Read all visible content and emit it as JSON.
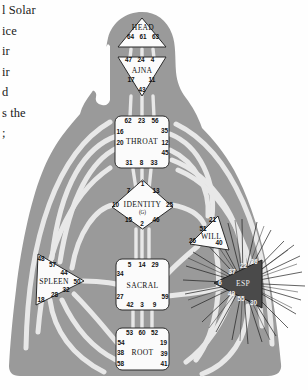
{
  "page": {
    "book_text_lines": [
      "l  Solar",
      "ice",
      "ir",
      "ir",
      "d",
      "s the",
      ";"
    ],
    "diagram_title": "Human Design BodyGraph"
  },
  "colors": {
    "body_silhouette": "#9a9a9a",
    "channel_open": "#e8e8e8",
    "center_open_fill": "#fbfbfb",
    "center_defined_fill": "#4a4a4a",
    "center_stroke": "#2b2b2b",
    "gate_text": "#111111",
    "gate_text_light": "#f2f2f2",
    "page_background": "#ffffff",
    "ray_stroke": "#1d1d1d"
  },
  "centers": [
    {
      "id": "head",
      "name": "HEAD",
      "shape": "triangle-up",
      "defined": false,
      "gates": [
        {
          "num": "64",
          "x": 130.5,
          "y": 38.5
        },
        {
          "num": "61",
          "x": 143.0,
          "y": 38.5
        },
        {
          "num": "63",
          "x": 155.5,
          "y": 38.5
        }
      ],
      "label": {
        "x": 143.0,
        "y": 29.5
      }
    },
    {
      "id": "ajna",
      "name": "AJNA",
      "shape": "triangle-down",
      "defined": false,
      "gates": [
        {
          "num": "47",
          "x": 128.5,
          "y": 61.0
        },
        {
          "num": "24",
          "x": 141.0,
          "y": 61.0
        },
        {
          "num": "4",
          "x": 152.5,
          "y": 61.0
        },
        {
          "num": "17",
          "x": 131.0,
          "y": 80.0
        },
        {
          "num": "11",
          "x": 152.0,
          "y": 80.0
        },
        {
          "num": "43",
          "x": 142.0,
          "y": 91.0
        }
      ],
      "label": {
        "x": 142.0,
        "y": 71.5
      }
    },
    {
      "id": "throat",
      "name": "THROAT",
      "shape": "square",
      "defined": false,
      "gates": [
        {
          "num": "62",
          "x": 128.0,
          "y": 121.5
        },
        {
          "num": "23",
          "x": 141.5,
          "y": 121.5
        },
        {
          "num": "56",
          "x": 155.0,
          "y": 121.5
        },
        {
          "num": "16",
          "x": 118.5,
          "y": 132.5
        },
        {
          "num": "35",
          "x": 165.5,
          "y": 131.5
        },
        {
          "num": "20",
          "x": 118.5,
          "y": 143.5
        },
        {
          "num": "12",
          "x": 166.0,
          "y": 142.5
        },
        {
          "num": "45",
          "x": 166.0,
          "y": 153.0
        },
        {
          "num": "31",
          "x": 129.0,
          "y": 163.0
        },
        {
          "num": "8",
          "x": 141.5,
          "y": 163.0
        },
        {
          "num": "33",
          "x": 154.0,
          "y": 163.0
        }
      ],
      "label": {
        "x": 142.0,
        "y": 141.5
      }
    },
    {
      "id": "identity",
      "name": "IDENTITY",
      "sub_label": "(G)",
      "shape": "diamond",
      "defined": false,
      "gates": [
        {
          "num": "1",
          "x": 142.5,
          "y": 184.5
        },
        {
          "num": "7",
          "x": 128.5,
          "y": 191.5
        },
        {
          "num": "13",
          "x": 156.0,
          "y": 191.5
        },
        {
          "num": "10",
          "x": 115.5,
          "y": 205.0
        },
        {
          "num": "25",
          "x": 169.5,
          "y": 205.0
        },
        {
          "num": "15",
          "x": 128.5,
          "y": 220.0
        },
        {
          "num": "2",
          "x": 142.0,
          "y": 224.0
        },
        {
          "num": "46",
          "x": 156.0,
          "y": 220.0
        }
      ],
      "label": {
        "x": 142.5,
        "y": 206.0
      },
      "sub_label_pos": {
        "x": 142.5,
        "y": 213.0
      }
    },
    {
      "id": "will",
      "name": "WILL",
      "shape": "triangle-right",
      "defined": false,
      "gates": [
        {
          "num": "21",
          "x": 212.5,
          "y": 220.0
        },
        {
          "num": "51",
          "x": 203.0,
          "y": 229.0
        },
        {
          "num": "26",
          "x": 192.5,
          "y": 240.5
        },
        {
          "num": "40",
          "x": 219.0,
          "y": 243.0
        }
      ],
      "label": {
        "x": 210.0,
        "y": 236.0
      }
    },
    {
      "id": "spleen",
      "name": "SPLEEN",
      "shape": "triangle-left",
      "defined": false,
      "gates": [
        {
          "num": "48",
          "x": 40.0,
          "y": 258.5
        },
        {
          "num": "57",
          "x": 52.0,
          "y": 264.0
        },
        {
          "num": "44",
          "x": 63.0,
          "y": 272.5
        },
        {
          "num": "50",
          "x": 78.0,
          "y": 281.0
        },
        {
          "num": "32",
          "x": 65.0,
          "y": 290.5
        },
        {
          "num": "28",
          "x": 54.0,
          "y": 294.5
        },
        {
          "num": "18",
          "x": 40.5,
          "y": 299.5
        }
      ],
      "label": {
        "x": 52.0,
        "y": 281.5
      }
    },
    {
      "id": "sacral",
      "name": "SACRAL",
      "shape": "square",
      "defined": false,
      "gates": [
        {
          "num": "5",
          "x": 129.5,
          "y": 265.0
        },
        {
          "num": "14",
          "x": 142.0,
          "y": 265.0
        },
        {
          "num": "29",
          "x": 155.0,
          "y": 265.0
        },
        {
          "num": "34",
          "x": 120.0,
          "y": 274.0
        },
        {
          "num": "27",
          "x": 120.0,
          "y": 296.5
        },
        {
          "num": "59",
          "x": 165.0,
          "y": 296.5
        },
        {
          "num": "42",
          "x": 130.0,
          "y": 304.5
        },
        {
          "num": "3",
          "x": 142.0,
          "y": 304.5
        },
        {
          "num": "9",
          "x": 154.5,
          "y": 304.5
        }
      ],
      "label": {
        "x": 142.5,
        "y": 286.0
      }
    },
    {
      "id": "root",
      "name": "ROOT",
      "shape": "square",
      "defined": false,
      "gates": [
        {
          "num": "53",
          "x": 129.5,
          "y": 333.5
        },
        {
          "num": "60",
          "x": 142.0,
          "y": 333.5
        },
        {
          "num": "52",
          "x": 154.5,
          "y": 333.5
        },
        {
          "num": "54",
          "x": 121.0,
          "y": 343.0
        },
        {
          "num": "19",
          "x": 163.5,
          "y": 343.0
        },
        {
          "num": "38",
          "x": 120.5,
          "y": 353.0
        },
        {
          "num": "39",
          "x": 164.0,
          "y": 353.5
        },
        {
          "num": "58",
          "x": 120.5,
          "y": 363.5
        },
        {
          "num": "41",
          "x": 164.0,
          "y": 363.5
        }
      ],
      "label": {
        "x": 142.5,
        "y": 353.0
      }
    },
    {
      "id": "esp",
      "name": "ESP",
      "shape": "triangle-left",
      "defined": true,
      "gates": [
        {
          "num": "22",
          "x": 243.5,
          "y": 265.5
        },
        {
          "num": "36",
          "x": 253.5,
          "y": 261.5
        },
        {
          "num": "37",
          "x": 232.0,
          "y": 271.5
        },
        {
          "num": "6",
          "x": 220.0,
          "y": 283.0
        },
        {
          "num": "49",
          "x": 231.5,
          "y": 293.5
        },
        {
          "num": "55",
          "x": 241.0,
          "y": 298.5
        },
        {
          "num": "30",
          "x": 253.0,
          "y": 302.5
        }
      ],
      "label": {
        "x": 243.0,
        "y": 284.0
      }
    }
  ]
}
